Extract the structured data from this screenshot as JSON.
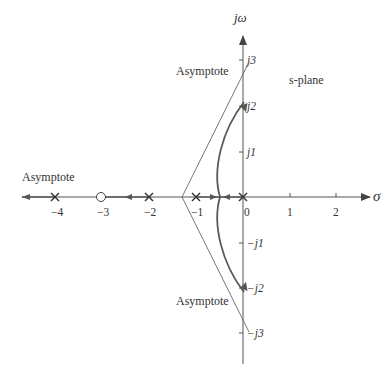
{
  "diagram": {
    "type": "root-locus",
    "plane_label": "s-plane",
    "axes": {
      "real_axis_label": "σ",
      "imag_axis_label": "jω",
      "real_ticks": [
        {
          "value": -4,
          "label": "−4"
        },
        {
          "value": -3,
          "label": "−3"
        },
        {
          "value": -2,
          "label": "−2"
        },
        {
          "value": -1,
          "label": "−1"
        },
        {
          "value": 0,
          "label": "0"
        },
        {
          "value": 1,
          "label": "1"
        },
        {
          "value": 2,
          "label": "2"
        }
      ],
      "imag_ticks": [
        {
          "value": 3,
          "label": "j3"
        },
        {
          "value": 2,
          "label": "j2"
        },
        {
          "value": 1,
          "label": "j1"
        },
        {
          "value": -1,
          "label": "−j1"
        },
        {
          "value": -2,
          "label": "−j2"
        },
        {
          "value": -3,
          "label": "−j3"
        }
      ]
    },
    "poles": [
      0,
      -1,
      -2,
      -4
    ],
    "zeros": [
      -3
    ],
    "asymptote_labels": {
      "upper": "Asymptote",
      "lower": "Asymptote",
      "left": "Asymptote"
    },
    "asymptote_centroid": -1.33,
    "colors": {
      "axis": "#555555",
      "locus": "#666666",
      "asymptote": "#666666",
      "text": "#333333"
    }
  }
}
